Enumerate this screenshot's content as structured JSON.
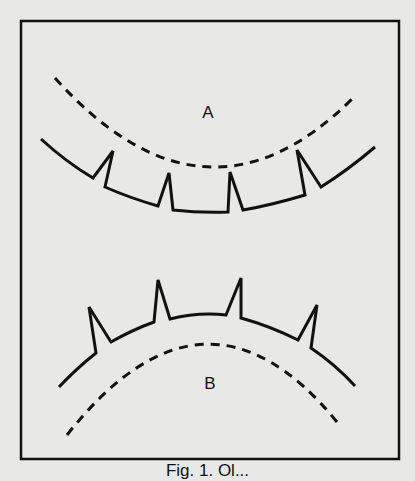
{
  "figure": {
    "frame": {
      "x": 21,
      "y": 21,
      "width": 378,
      "height": 438
    },
    "panels": [
      {
        "label": "A",
        "label_pos": [
          208,
          112
        ],
        "dashed_curve": "M55,78 Q205,245 352,99",
        "solid_outline": "M41,139 Q66,162 93,178 L113,151 L105,187 Q130,198 158,206 L169,173 L173,210 Q200,213 228,212 L230,172 L243,210 Q272,205 305,195 L297,150 L321,187 Q348,170 375,147"
      },
      {
        "label": "B",
        "label_pos": [
          210,
          383
        ],
        "dashed_curve": "M67,435 Q205,260 337,422",
        "solid_outline": "M59,387 Q77,368 96,353 L89,307 L111,342 Q132,330 154,322 L158,280 L170,319 Q198,312 226,315 L241,278 L241,318 Q270,326 298,340 L317,305 L311,348 Q336,365 355,386"
      }
    ],
    "colors": {
      "line": "#111111",
      "background": "#e8e8e6"
    },
    "caption": "Fig. 1. Ol..."
  }
}
